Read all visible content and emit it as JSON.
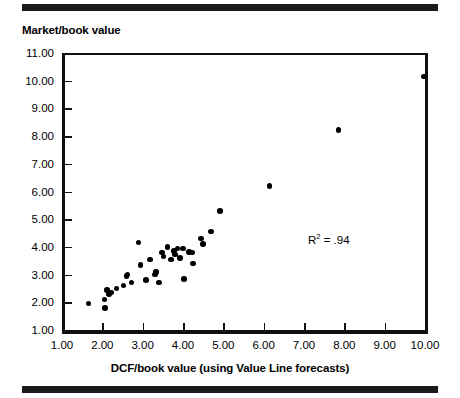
{
  "figure": {
    "title": "Market/book value",
    "annotation_prefix": "R",
    "annotation_exponent": "2",
    "annotation_value": " = .94",
    "rule_color": "#1a1a1a",
    "point_color": "#000000"
  },
  "chart_data": {
    "type": "scatter",
    "title": "Market/book value",
    "xlabel": "DCF/book value (using Value Line forecasts)",
    "ylabel": "Market/book value",
    "xlim": [
      1.0,
      10.0
    ],
    "ylim": [
      1.0,
      11.0
    ],
    "grid": false,
    "legend": null,
    "xticks": [
      1.0,
      2.0,
      3.0,
      4.0,
      5.0,
      6.0,
      7.0,
      8.0,
      9.0,
      10.0
    ],
    "xtick_labels": [
      "1.00",
      "2.00",
      "3.00",
      "4.00",
      "5.00",
      "6.00",
      "7.00",
      "8.00",
      "9.00",
      "10.00"
    ],
    "yticks": [
      1.0,
      2.0,
      3.0,
      4.0,
      5.0,
      6.0,
      7.0,
      8.0,
      9.0,
      10.0,
      11.0
    ],
    "ytick_labels": [
      "1.00",
      "2.00",
      "3.00",
      "4.00",
      "5.00",
      "6.00",
      "7.00",
      "8.00",
      "9.00",
      "10.00",
      "11.00"
    ],
    "annotations": [
      {
        "text": "R2 = .94",
        "x": 7.1,
        "y": 4.55
      }
    ],
    "series": [
      {
        "name": "firms",
        "marker": "filled-circle",
        "color": "#000000",
        "points": [
          [
            1.66,
            1.95
          ],
          [
            2.05,
            2.1
          ],
          [
            2.07,
            1.8
          ],
          [
            2.12,
            2.45
          ],
          [
            2.16,
            2.3
          ],
          [
            2.22,
            2.35
          ],
          [
            2.35,
            2.5
          ],
          [
            2.52,
            2.6
          ],
          [
            2.6,
            2.95
          ],
          [
            2.62,
            3.0
          ],
          [
            2.72,
            2.72
          ],
          [
            2.9,
            4.15
          ],
          [
            2.95,
            3.35
          ],
          [
            3.08,
            2.8
          ],
          [
            3.18,
            3.55
          ],
          [
            3.3,
            3.0
          ],
          [
            3.33,
            3.1
          ],
          [
            3.4,
            2.72
          ],
          [
            3.48,
            3.8
          ],
          [
            3.52,
            3.65
          ],
          [
            3.62,
            4.0
          ],
          [
            3.7,
            3.55
          ],
          [
            3.78,
            3.85
          ],
          [
            3.8,
            3.72
          ],
          [
            3.86,
            3.95
          ],
          [
            3.92,
            3.6
          ],
          [
            4.0,
            3.95
          ],
          [
            4.02,
            2.85
          ],
          [
            4.15,
            3.82
          ],
          [
            4.22,
            3.8
          ],
          [
            4.25,
            3.4
          ],
          [
            4.45,
            4.3
          ],
          [
            4.5,
            4.1
          ],
          [
            4.7,
            4.55
          ],
          [
            4.92,
            5.3
          ],
          [
            6.15,
            6.2
          ],
          [
            7.85,
            8.22
          ],
          [
            9.98,
            10.15
          ]
        ]
      }
    ]
  }
}
